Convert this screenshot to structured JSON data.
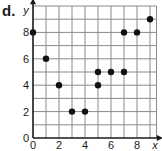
{
  "problem_label": "d.",
  "chart_data": {
    "type": "scatter",
    "title": "",
    "xlabel": "x",
    "ylabel": "y",
    "xlim": [
      0,
      9.5
    ],
    "ylim": [
      0,
      10
    ],
    "grid": true,
    "x_ticks": [
      "0",
      "2",
      "4",
      "6",
      "8"
    ],
    "y_ticks": [
      "0",
      "2",
      "4",
      "6",
      "8"
    ],
    "points": [
      {
        "x": 0,
        "y": 8
      },
      {
        "x": 1,
        "y": 6
      },
      {
        "x": 2,
        "y": 4
      },
      {
        "x": 3,
        "y": 2
      },
      {
        "x": 4,
        "y": 2
      },
      {
        "x": 5,
        "y": 4
      },
      {
        "x": 5,
        "y": 5
      },
      {
        "x": 6,
        "y": 5
      },
      {
        "x": 7,
        "y": 5
      },
      {
        "x": 7,
        "y": 8
      },
      {
        "x": 8,
        "y": 8
      },
      {
        "x": 9,
        "y": 9
      }
    ],
    "point_color": "#111111",
    "grid_color": "#8a8a8a"
  }
}
